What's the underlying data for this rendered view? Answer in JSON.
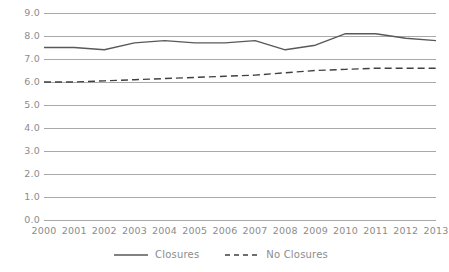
{
  "chart_data": {
    "type": "line",
    "title": "",
    "subtitle": "",
    "xlabel": "",
    "ylabel": "",
    "categories": [
      "2000",
      "2001",
      "2002",
      "2003",
      "2004",
      "2005",
      "2006",
      "2007",
      "2008",
      "2009",
      "2010",
      "2011",
      "2012",
      "2013"
    ],
    "ylim": [
      0.0,
      9.0
    ],
    "xlim_categories": [
      "2000",
      "2013"
    ],
    "ytick_labels": [
      "9.0",
      "8.0",
      "7.0",
      "6.0",
      "5.0",
      "4.0",
      "3.0",
      "2.0",
      "1.0",
      "0.0"
    ],
    "ytick_values": [
      9.0,
      8.0,
      7.0,
      6.0,
      5.0,
      4.0,
      3.0,
      2.0,
      1.0,
      0.0
    ],
    "grid": true,
    "grid_color": "#a9a9a9",
    "legend_position": "bottom-center",
    "series": [
      {
        "name": "Closures",
        "style": "solid",
        "color": "#595959",
        "values": [
          7.5,
          7.5,
          7.4,
          7.7,
          7.8,
          7.7,
          7.7,
          7.8,
          7.4,
          7.6,
          8.1,
          8.1,
          7.9,
          7.8
        ]
      },
      {
        "name": "No Closures",
        "style": "dashed",
        "color": "#404040",
        "values": [
          6.0,
          6.0,
          6.05,
          6.1,
          6.15,
          6.2,
          6.25,
          6.3,
          6.4,
          6.5,
          6.55,
          6.6,
          6.6,
          6.6
        ]
      }
    ]
  },
  "legend": {
    "items": [
      {
        "label": "Closures",
        "style": "solid"
      },
      {
        "label": "No Closures",
        "style": "dashed"
      }
    ]
  },
  "colors": {
    "grid": "#a9a9a9",
    "tick_text": "#8c8c8c",
    "series_solid": "#595959",
    "series_dashed": "#404040",
    "background": "#ffffff"
  }
}
